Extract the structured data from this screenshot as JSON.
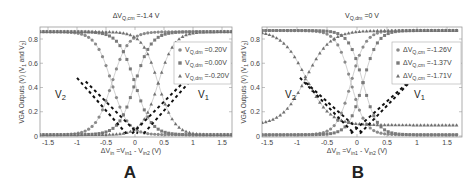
{
  "chart_data": [
    {
      "panel": "A",
      "type": "scatter",
      "title": "ΔV_Q,cm =-1.4 V",
      "xlabel": "ΔV_in =V_in1 - V_in2 (V)",
      "ylabel": "VGA Outputs (V) (V_1 and V_2)",
      "xlim": [
        -1.65,
        1.65
      ],
      "ylim": [
        0,
        0.87
      ],
      "xticks": [
        "-1.5",
        "-1",
        "-0.5",
        "0",
        "0.5",
        "1",
        "1.5"
      ],
      "yticks": [
        "0",
        "0.2",
        "0.4",
        "0.6",
        "0.8"
      ],
      "grid": false,
      "legend_position": "upper right",
      "legend": [
        "V_Q,dm =0.20V",
        "V_Q,dm =0.00V",
        "V_Q,dm =-0.20V"
      ],
      "annotations": [
        "V_2",
        "V_1"
      ],
      "series": [
        {
          "name": "V_Q,dm =0.20V",
          "marker": "circle",
          "center": -0.4,
          "high": 0.86,
          "low": 0.01
        },
        {
          "name": "V_Q,dm =0.00V",
          "marker": "square",
          "center": 0.0,
          "high": 0.86,
          "low": 0.01
        },
        {
          "name": "V_Q,dm =-0.20V",
          "marker": "triangle",
          "center": 0.4,
          "high": 0.86,
          "low": 0.01
        }
      ],
      "dashed_lines": [
        {
          "name": "V_2",
          "points": [
            [
              -1.0,
              0.48
            ],
            [
              -0.15,
              0.02
            ]
          ]
        },
        {
          "name": "V_2",
          "points": [
            [
              -0.85,
              0.45
            ],
            [
              0.05,
              0.02
            ]
          ]
        },
        {
          "name": "V_1",
          "points": [
            [
              0.15,
              0.02
            ],
            [
              1.0,
              0.48
            ]
          ]
        },
        {
          "name": "V_1",
          "points": [
            [
              -0.05,
              0.02
            ],
            [
              0.85,
              0.45
            ]
          ]
        }
      ],
      "panel_label": "A"
    },
    {
      "panel": "B",
      "type": "scatter",
      "title": "V_Q,dm =0 V",
      "xlabel": "ΔV_in =V_in1 - V_in2 (V)",
      "ylabel": "VGA Outputs (V) (V_1 and V_2)",
      "xlim": [
        -1.65,
        1.65
      ],
      "ylim": [
        0,
        0.87
      ],
      "xticks": [
        "-1.5",
        "-1",
        "-0.5",
        "0",
        "0.5",
        "1",
        "1.5"
      ],
      "yticks": [
        "0",
        "0.2",
        "0.4",
        "0.6",
        "0.8"
      ],
      "grid": false,
      "legend_position": "upper right",
      "legend": [
        "ΔV_Q,cm =-1.26V",
        "ΔV_Q,cm =-1.37V",
        "ΔV_Q,cm =-1.71V"
      ],
      "annotations": [
        "V_2",
        "V_1"
      ],
      "series": [
        {
          "name": "ΔV_Q,cm =-1.26V",
          "marker": "circle",
          "center": -0.1,
          "high": 0.87,
          "low": 0.01,
          "width": 0.12
        },
        {
          "name": "ΔV_Q,cm =-1.37V",
          "marker": "square",
          "center": 0.1,
          "high": 0.87,
          "low": 0.01,
          "width": 0.12
        },
        {
          "name": "ΔV_Q,cm =-1.71V",
          "marker": "triangle",
          "center": -0.85,
          "high": 0.87,
          "low": 0.09,
          "width": 0.2
        }
      ],
      "dashed_lines": [
        {
          "name": "V_2",
          "points": [
            [
              -0.95,
              0.48
            ],
            [
              -0.05,
              0.02
            ]
          ]
        },
        {
          "name": "V_2",
          "points": [
            [
              -0.85,
              0.44
            ],
            [
              0.1,
              0.02
            ]
          ]
        },
        {
          "name": "V_1",
          "points": [
            [
              0.05,
              0.02
            ],
            [
              0.95,
              0.48
            ]
          ]
        },
        {
          "name": "V_1",
          "points": [
            [
              -0.1,
              0.02
            ],
            [
              0.85,
              0.44
            ]
          ]
        }
      ],
      "panel_label": "B"
    }
  ]
}
